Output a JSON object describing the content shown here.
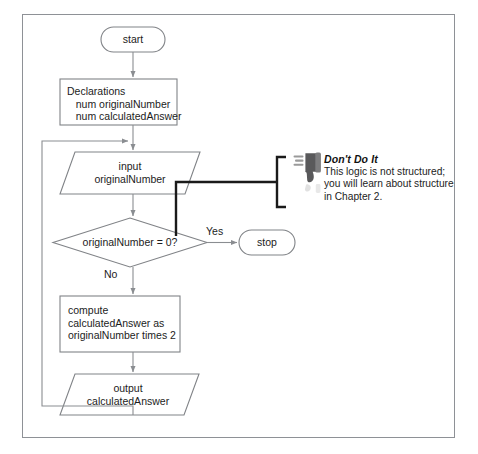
{
  "figure": {
    "type": "flowchart"
  },
  "nodes": {
    "start": {
      "shape": "terminator",
      "label": "start"
    },
    "declarations": {
      "shape": "process",
      "lines": [
        "Declarations",
        "   num originalNumber",
        "   num calculatedAnswer"
      ],
      "text": "Declarations\n   num originalNumber\n   num calculatedAnswer"
    },
    "input": {
      "shape": "parallelogram",
      "lines": [
        "input",
        "originalNumber"
      ],
      "text": "input\noriginalNumber"
    },
    "decision": {
      "shape": "diamond",
      "label": "originalNumber = 0?"
    },
    "stop": {
      "shape": "terminator",
      "label": "stop"
    },
    "compute": {
      "shape": "process",
      "lines": [
        "compute",
        "calculatedAnswer as",
        "originalNumber times 2"
      ],
      "text": "compute\ncalculatedAnswer as\noriginalNumber times 2"
    },
    "output": {
      "shape": "parallelogram",
      "lines": [
        "output",
        "calculatedAnswer"
      ],
      "text": "output\ncalculatedAnswer"
    }
  },
  "branch_labels": {
    "yes": "Yes",
    "no": "No"
  },
  "callout": {
    "heading": "Don't Do It",
    "body": "This logic is not structured;\nyou will learn about structure\nin Chapter 2.",
    "body_lines": [
      "This logic is not structured;",
      "you will learn about structure",
      "in Chapter 2."
    ],
    "icon": "thumbs-down-icon"
  },
  "colors": {
    "frame": "#8e9196",
    "shape_stroke": "#808387",
    "connector": "#8a8d91",
    "callout_line": "#1a1a1a",
    "text": "#1c1c1c",
    "icon_dark": "#595959",
    "icon_mid": "#8f8f8f",
    "background": "#ffffff"
  }
}
